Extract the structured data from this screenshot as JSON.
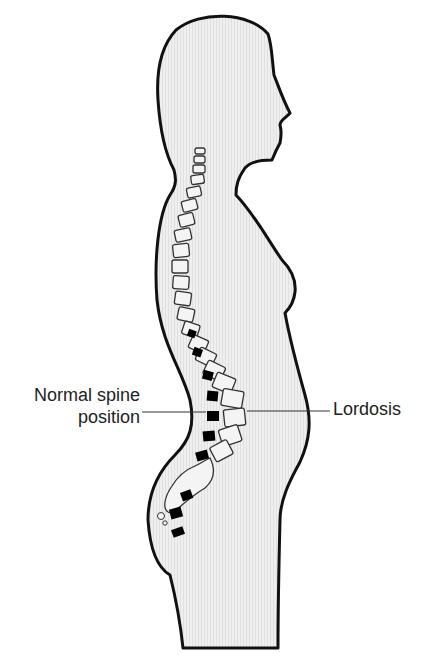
{
  "figure": {
    "labels": {
      "normal_spine_line1": "Normal spine",
      "normal_spine_line2": "position",
      "lordosis": "Lordosis"
    },
    "colors": {
      "body_fill": "#ececec",
      "outline": "#111111",
      "normal_vertebra": "#000000",
      "lordosis_vertebra_fill": "#f4f4f4",
      "leader_line": "#333333"
    }
  }
}
